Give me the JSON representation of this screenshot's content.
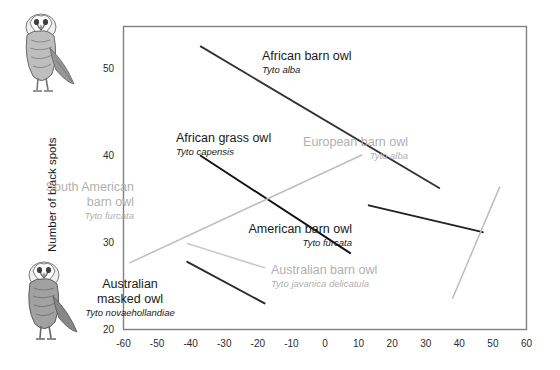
{
  "chart_data": {
    "type": "line",
    "title": "",
    "xlabel": "",
    "ylabel": "Number of black spots",
    "xlim": [
      -60,
      60
    ],
    "ylim": [
      20,
      55
    ],
    "xticks": [
      "-60",
      "-50",
      "-40",
      "-30",
      "-20",
      "-10",
      "0",
      "10",
      "20",
      "30",
      "40",
      "50",
      "60"
    ],
    "yticks": [
      "20",
      "30",
      "40",
      "50"
    ],
    "grid": false,
    "legend": "inline-annotations",
    "series": [
      {
        "name": "African barn owl",
        "scientific": "Tyto alba",
        "color": "#333333",
        "points": [
          [
            -37,
            52.6
          ],
          [
            34,
            36.3
          ]
        ]
      },
      {
        "name": "African grass owl",
        "scientific": "Tyto capensis",
        "color": "#111111",
        "points": [
          [
            -37,
            40.0
          ],
          [
            7.5,
            28.8
          ]
        ]
      },
      {
        "name": "South American barn owl",
        "scientific": "Tyto furcata",
        "color": "#bdbdbd",
        "points": [
          [
            -58,
            27.7
          ],
          [
            11,
            40.1
          ]
        ]
      },
      {
        "name": "American barn owl",
        "scientific": "Tyto furcata",
        "color": "#222222",
        "points": [
          [
            13,
            34.3
          ],
          [
            47,
            31.2
          ]
        ]
      },
      {
        "name": "European barn owl",
        "scientific": "Tyto alba",
        "color": "#bdbdbd",
        "points": [
          [
            38,
            23.6
          ],
          [
            52,
            36.4
          ]
        ]
      },
      {
        "name": "Australian barn owl",
        "scientific": "Tyto javanica delicatula",
        "color": "#c9c9c9",
        "points": [
          [
            -41,
            29.9
          ],
          [
            -18,
            27.1
          ]
        ]
      },
      {
        "name": "Australian masked owl",
        "scientific": "Tyto novaehollandiae",
        "color": "#2b2b2b",
        "points": [
          [
            -41,
            27.8
          ],
          [
            -18,
            23.0
          ]
        ]
      }
    ],
    "annotations": [
      {
        "name": "African barn owl",
        "scientific": "Tyto alba",
        "style": "dark",
        "align": "left",
        "x": 262,
        "y": 49
      },
      {
        "name": "African grass owl",
        "scientific": "Tyto capensis",
        "style": "dark",
        "align": "left",
        "x": 176,
        "y": 131
      },
      {
        "name": "European barn owl",
        "scientific": "Tyto alba",
        "style": "grey",
        "align": "right",
        "x": 408,
        "y": 135
      },
      {
        "name": "South American barn owl",
        "scientific": "Tyto furcata",
        "style": "grey",
        "align": "right",
        "x": 134,
        "y": 180
      },
      {
        "name": "American barn owl",
        "scientific": "Tyto furcata",
        "style": "dark",
        "align": "right",
        "x": 352,
        "y": 222
      },
      {
        "name": "Australian barn owl",
        "scientific": "Tyto javanica delicatula",
        "style": "grey",
        "align": "left",
        "x": 271,
        "y": 263
      },
      {
        "name": "Australian masked owl",
        "scientific": "Tyto novaehollandiae",
        "style": "dark",
        "align": "center",
        "x": 130,
        "y": 277
      }
    ],
    "images": [
      {
        "name": "barn-owl-illustration-top"
      },
      {
        "name": "barn-owl-illustration-bottom"
      }
    ]
  }
}
